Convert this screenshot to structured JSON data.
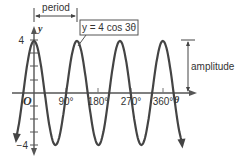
{
  "diagram": {
    "equation_label": "y = 4 cos 3θ",
    "period_label": "period",
    "amplitude_label": "amplitude",
    "x_axis_label": "θ",
    "y_axis_label": "y",
    "origin_label": "O",
    "x_ticks": [
      "90°",
      "180°",
      "270°",
      "360°"
    ],
    "y_ticks": [
      "4",
      "−4"
    ],
    "curve_color": "#444444"
  },
  "chart_data": {
    "type": "line",
    "title": "y = 4 cos 3θ",
    "xlabel": "θ",
    "ylabel": "y",
    "xlim": [
      -10,
      400
    ],
    "ylim": [
      -4,
      4
    ],
    "x_ticks": [
      90,
      180,
      270,
      360
    ],
    "y_ticks": [
      -4,
      4
    ],
    "function": "4*cos(3*theta)",
    "amplitude": 4,
    "period_degrees": 120,
    "annotations": [
      "period",
      "amplitude"
    ]
  }
}
